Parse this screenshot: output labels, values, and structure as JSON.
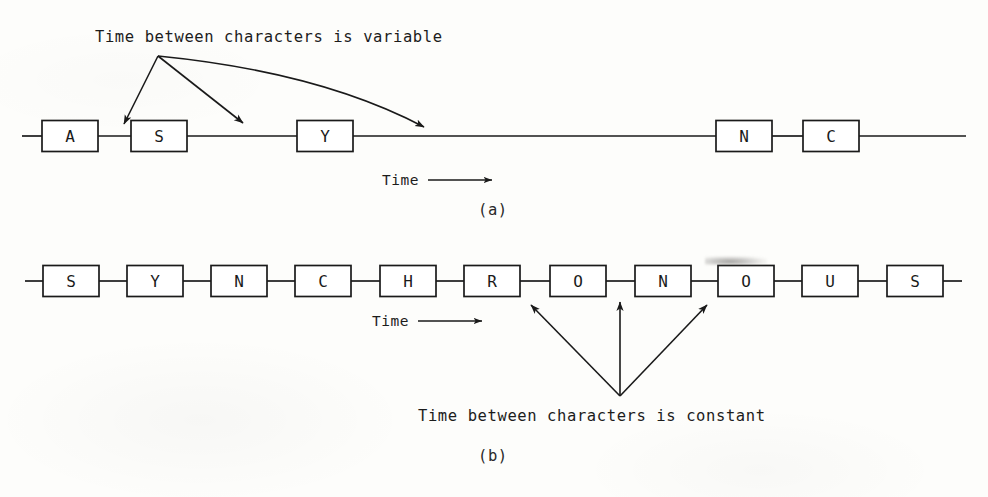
{
  "figure": {
    "panel_a": {
      "label": "(a)",
      "annotation": "Time between characters is variable",
      "axis_label": "Time",
      "axis_arrow": "right-arrow",
      "characters": [
        "A",
        "S",
        "Y",
        "N",
        "C"
      ],
      "character_boxes": [
        {
          "letter": "A",
          "x": 42,
          "y": 120,
          "w": 56,
          "h": 31
        },
        {
          "letter": "S",
          "x": 131,
          "y": 120,
          "w": 56,
          "h": 31
        },
        {
          "letter": "Y",
          "x": 297,
          "y": 120,
          "w": 56,
          "h": 31
        },
        {
          "letter": "N",
          "x": 716,
          "y": 120,
          "w": 56,
          "h": 31
        },
        {
          "letter": "C",
          "x": 803,
          "y": 120,
          "w": 56,
          "h": 31
        }
      ],
      "baseline": {
        "y": 136,
        "x_start": 22,
        "x_end": 966
      },
      "annotation_origin": {
        "x": 158,
        "y": 56
      },
      "annotation_arrow_targets": [
        {
          "x": 124,
          "y": 127
        },
        {
          "x": 244,
          "y": 127
        },
        {
          "x": 425,
          "y": 131
        }
      ]
    },
    "panel_b": {
      "label": "(b)",
      "annotation": "Time between characters is constant",
      "axis_label": "Time",
      "axis_arrow": "right-arrow",
      "characters": [
        "S",
        "Y",
        "N",
        "C",
        "H",
        "R",
        "O",
        "N",
        "O",
        "U",
        "S"
      ],
      "character_boxes": [
        {
          "letter": "S",
          "x": 43,
          "y": 265,
          "w": 56,
          "h": 31
        },
        {
          "letter": "Y",
          "x": 127,
          "y": 265,
          "w": 56,
          "h": 31
        },
        {
          "letter": "N",
          "x": 211,
          "y": 265,
          "w": 56,
          "h": 31
        },
        {
          "letter": "C",
          "x": 295,
          "y": 265,
          "w": 56,
          "h": 31
        },
        {
          "letter": "H",
          "x": 380,
          "y": 265,
          "w": 56,
          "h": 31
        },
        {
          "letter": "R",
          "x": 464,
          "y": 265,
          "w": 56,
          "h": 31
        },
        {
          "letter": "O",
          "x": 550,
          "y": 265,
          "w": 56,
          "h": 31
        },
        {
          "letter": "N",
          "x": 635,
          "y": 265,
          "w": 56,
          "h": 31
        },
        {
          "letter": "O",
          "x": 718,
          "y": 265,
          "w": 56,
          "h": 31
        },
        {
          "letter": "U",
          "x": 802,
          "y": 265,
          "w": 56,
          "h": 31
        },
        {
          "letter": "S",
          "x": 887,
          "y": 265,
          "w": 56,
          "h": 31
        }
      ],
      "baseline": {
        "y": 281,
        "x_start": 25,
        "x_end": 962
      },
      "annotation_origin": {
        "x": 620,
        "y": 396
      },
      "annotation_arrow_targets": [
        {
          "x": 530,
          "y": 305
        },
        {
          "x": 620,
          "y": 302
        },
        {
          "x": 706,
          "y": 305
        }
      ]
    },
    "stroke_color": "#1a1a1a"
  }
}
